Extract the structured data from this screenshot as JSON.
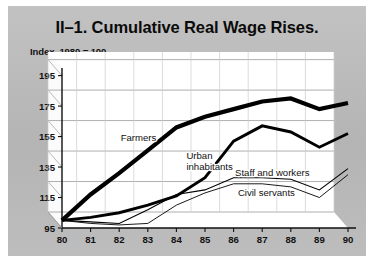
{
  "figure": {
    "title": "II–1. Cumulative Real Wage Rises.",
    "subtitle": "Index, 1980 = 100",
    "page_background": "#b9b9b9",
    "plot_background": "#ffffff",
    "frame_color": "#ffffff"
  },
  "chart_data": {
    "type": "line",
    "title": "II–1. Cumulative Real Wage Rises.",
    "subtitle": "Index, 1980 = 100",
    "xlabel": "",
    "ylabel": "",
    "x": [
      "80",
      "81",
      "82",
      "83",
      "84",
      "85",
      "86",
      "87",
      "88",
      "89",
      "90"
    ],
    "xlim": [
      80,
      90
    ],
    "ylim": [
      95,
      200
    ],
    "yticks": [
      95,
      115,
      135,
      155,
      175,
      195
    ],
    "grid": true,
    "legend": "inline-labels",
    "style": "3d-skewed-wall",
    "series": [
      {
        "name": "Farmers",
        "color": "#000000",
        "width": 4.2,
        "values": [
          100,
          117,
          131,
          146,
          161,
          168,
          173,
          178,
          180,
          173,
          177
        ]
      },
      {
        "name": "Urban inhabitants",
        "color": "#000000",
        "width": 2.9,
        "values": [
          100,
          102,
          105,
          110,
          116,
          128,
          152,
          162,
          158,
          148,
          157
        ]
      },
      {
        "name": "Staff and workers",
        "color": "#000000",
        "width": 1.1,
        "values": [
          100,
          99,
          98,
          107,
          117,
          120,
          128,
          128,
          127,
          120,
          134
        ]
      },
      {
        "name": "Civil servants",
        "color": "#000000",
        "width": 0.9,
        "values": [
          100,
          98,
          97,
          98,
          110,
          118,
          124,
          124,
          122,
          115,
          130
        ]
      }
    ],
    "annotations": [
      {
        "text": "Farmers",
        "x": 82.05,
        "y": 152
      },
      {
        "text": "Urban",
        "x": 84.35,
        "y": 140
      },
      {
        "text": "inhabitants",
        "x": 84.35,
        "y": 133
      },
      {
        "text": "Staff and workers",
        "x": 86.05,
        "y": 129
      },
      {
        "text": "Civil servants",
        "x": 86.15,
        "y": 116
      }
    ]
  }
}
